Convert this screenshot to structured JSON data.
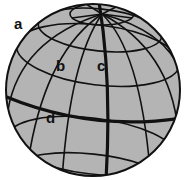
{
  "diagram": {
    "colors": {
      "sphere_fill": "#b4b4b4",
      "grid_line": "#111111",
      "background": "#ffffff"
    },
    "labels": [
      {
        "id": "a",
        "text": "a",
        "x": 14,
        "y": 16
      },
      {
        "id": "b",
        "text": "b",
        "x": 56,
        "y": 58
      },
      {
        "id": "c",
        "text": "c",
        "x": 97,
        "y": 58
      },
      {
        "id": "d",
        "text": "d",
        "x": 46,
        "y": 110
      }
    ],
    "highlighted_lines": [
      {
        "label": "c",
        "kind": "meridian (line of longitude)"
      },
      {
        "label": "d",
        "kind": "equator (line of latitude)"
      }
    ]
  }
}
